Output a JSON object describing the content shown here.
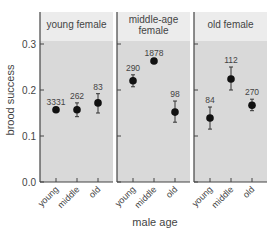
{
  "chart_data": {
    "type": "scatter",
    "subtype": "point-with-error-bars, faceted",
    "xlabel": "male age",
    "ylabel": "brood success",
    "ylim": [
      0.0,
      0.33
    ],
    "yticks": [
      "0.0",
      "0.1",
      "0.2",
      "0.3"
    ],
    "categories": [
      "young",
      "middle",
      "old"
    ],
    "grid": false,
    "panels": [
      {
        "title": "young female",
        "points": [
          {
            "x": "young",
            "y": 0.157,
            "lo": 0.155,
            "hi": 0.159,
            "n": "3331"
          },
          {
            "x": "middle",
            "y": 0.157,
            "lo": 0.142,
            "hi": 0.172,
            "n": "262"
          },
          {
            "x": "old",
            "y": 0.172,
            "lo": 0.15,
            "hi": 0.192,
            "n": "83"
          }
        ]
      },
      {
        "title": "middle-age female",
        "points": [
          {
            "x": "young",
            "y": 0.22,
            "lo": 0.207,
            "hi": 0.233,
            "n": "290"
          },
          {
            "x": "middle",
            "y": 0.263,
            "lo": 0.261,
            "hi": 0.265,
            "n": "1878"
          },
          {
            "x": "old",
            "y": 0.152,
            "lo": 0.13,
            "hi": 0.176,
            "n": "98"
          }
        ]
      },
      {
        "title": "old female",
        "points": [
          {
            "x": "young",
            "y": 0.139,
            "lo": 0.115,
            "hi": 0.163,
            "n": "84"
          },
          {
            "x": "middle",
            "y": 0.224,
            "lo": 0.2,
            "hi": 0.25,
            "n": "112"
          },
          {
            "x": "old",
            "y": 0.167,
            "lo": 0.155,
            "hi": 0.18,
            "n": "270"
          }
        ]
      }
    ]
  },
  "colors": {
    "header_bg": "#ececec",
    "plot_bg": "#d9d9d9",
    "axis": "#444444",
    "point": "#111111"
  }
}
